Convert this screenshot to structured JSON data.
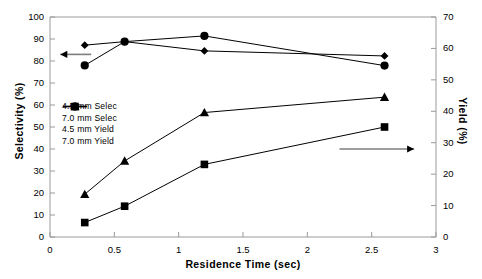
{
  "chart_data": {
    "type": "line",
    "title": "",
    "xlabel": "Residence Time (sec)",
    "ylabel": "Selectivity (%)",
    "y2label": "Yield (%)",
    "xlim": [
      0,
      3
    ],
    "ylim": [
      0,
      100
    ],
    "y2lim": [
      0,
      70
    ],
    "xticks": [
      "0",
      "0.5",
      "1",
      "1.5",
      "2",
      "2.5",
      "3"
    ],
    "xtick_values": [
      0,
      0.5,
      1,
      1.5,
      2,
      2.5,
      3
    ],
    "yticks": [
      "0",
      "10",
      "20",
      "30",
      "40",
      "50",
      "60",
      "70",
      "80",
      "90",
      "100"
    ],
    "ytick_values": [
      0,
      10,
      20,
      30,
      40,
      50,
      60,
      70,
      80,
      90,
      100
    ],
    "y2ticks": [
      "0",
      "10",
      "20",
      "30",
      "40",
      "50",
      "60",
      "70"
    ],
    "y2tick_values": [
      0,
      10,
      20,
      30,
      40,
      50,
      60,
      70
    ],
    "grid": false,
    "legend_position": "center-left",
    "series": [
      {
        "name": "4.5 mm Selec",
        "axis": "left",
        "marker": "circle",
        "x": [
          0.27,
          0.58,
          1.2,
          2.6
        ],
        "values": [
          78.0,
          88.8,
          91.4,
          77.9
        ]
      },
      {
        "name": "7.0 mm Selec",
        "axis": "left",
        "marker": "diamond",
        "x": [
          0.27,
          0.58,
          1.2,
          2.6
        ],
        "values": [
          87.2,
          88.8,
          84.6,
          82.3
        ]
      },
      {
        "name": "4.5 mm Yield",
        "axis": "right",
        "marker": "triangle",
        "x": [
          0.27,
          0.58,
          1.2,
          2.6
        ],
        "values": [
          13.6,
          24.2,
          39.6,
          44.5
        ]
      },
      {
        "name": "7.0 mm Yield",
        "axis": "right",
        "marker": "square",
        "x": [
          0.27,
          0.58,
          1.2,
          2.6
        ],
        "values": [
          4.6,
          9.8,
          23.1,
          35.0
        ]
      }
    ],
    "annotations": [
      {
        "name": "left-axis-arrow",
        "direction": "left",
        "y_left": 83.0,
        "x_from": 0.32,
        "x_to": 0.08
      },
      {
        "name": "right-axis-arrow",
        "direction": "right",
        "y_left": 40.0,
        "x_from": 2.25,
        "x_to": 2.83
      }
    ]
  }
}
